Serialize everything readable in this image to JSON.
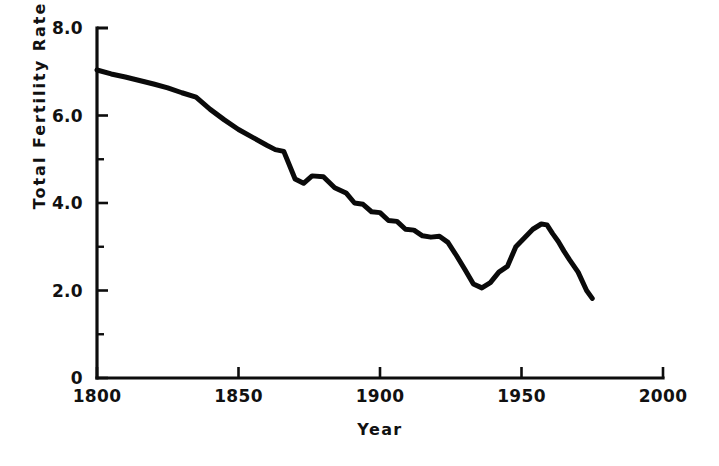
{
  "chart_data": {
    "type": "line",
    "title": "",
    "xlabel": "Year",
    "ylabel": "Total  Fertility  Rate",
    "xlim": [
      1800,
      2000
    ],
    "ylim": [
      0,
      8
    ],
    "grid": false,
    "legend": null,
    "x_ticks": [
      {
        "value": 1800,
        "label": "1800"
      },
      {
        "value": 1850,
        "label": "1850"
      },
      {
        "value": 1900,
        "label": "1900"
      },
      {
        "value": 1950,
        "label": "1950"
      },
      {
        "value": 2000,
        "label": "2000"
      }
    ],
    "y_ticks": [
      {
        "value": 0,
        "label": "0"
      },
      {
        "value": 2,
        "label": "2.0"
      },
      {
        "value": 4,
        "label": "4.0"
      },
      {
        "value": 6,
        "label": "6.0"
      },
      {
        "value": 8,
        "label": "8.0"
      }
    ],
    "y_minor_ticks": [
      1,
      3,
      5,
      7
    ],
    "series": [
      {
        "name": "Total Fertility Rate",
        "color": "#0a0a0a",
        "x": [
          1800,
          1805,
          1810,
          1815,
          1820,
          1825,
          1830,
          1835,
          1840,
          1845,
          1850,
          1855,
          1860,
          1863,
          1866,
          1870,
          1873,
          1876,
          1880,
          1884,
          1888,
          1891,
          1894,
          1897,
          1900,
          1903,
          1906,
          1909,
          1912,
          1915,
          1918,
          1921,
          1924,
          1927,
          1930,
          1933,
          1936,
          1939,
          1942,
          1945,
          1948,
          1951,
          1954,
          1957,
          1959,
          1961,
          1963,
          1965,
          1967,
          1970,
          1973,
          1975
        ],
        "y": [
          7.04,
          6.95,
          6.88,
          6.8,
          6.72,
          6.63,
          6.52,
          6.42,
          6.14,
          5.9,
          5.68,
          5.5,
          5.32,
          5.22,
          5.18,
          4.55,
          4.45,
          4.62,
          4.6,
          4.35,
          4.23,
          4.0,
          3.97,
          3.8,
          3.78,
          3.6,
          3.58,
          3.4,
          3.38,
          3.25,
          3.22,
          3.24,
          3.1,
          2.8,
          2.48,
          2.15,
          2.06,
          2.18,
          2.42,
          2.55,
          3.0,
          3.2,
          3.4,
          3.52,
          3.5,
          3.3,
          3.12,
          2.9,
          2.7,
          2.42,
          2.0,
          1.82
        ],
        "notable_points": [
          {
            "label": "start 1800",
            "x": 1800,
            "y": 7.04
          },
          {
            "label": "civil-war dip 1866",
            "x": 1866,
            "y": 4.45
          },
          {
            "label": "depression trough 1936",
            "x": 1936,
            "y": 2.06
          },
          {
            "label": "baby-boom peak 1957",
            "x": 1957,
            "y": 3.52
          },
          {
            "label": "end 1975",
            "x": 1975,
            "y": 1.82
          }
        ]
      }
    ]
  },
  "plot_geometry": {
    "left_px": 97,
    "right_px": 663,
    "top_px": 28,
    "bottom_px": 378
  }
}
